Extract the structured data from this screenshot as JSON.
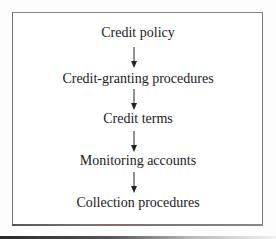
{
  "diagram": {
    "type": "flowchart",
    "direction": "top-to-bottom",
    "steps": [
      {
        "label": "Credit policy"
      },
      {
        "label": "Credit-granting procedures"
      },
      {
        "label": "Credit terms"
      },
      {
        "label": "Monitoring accounts"
      },
      {
        "label": "Collection procedures"
      }
    ],
    "edges": [
      {
        "from": 0,
        "to": 1,
        "icon": "arrow-down-icon"
      },
      {
        "from": 1,
        "to": 2,
        "icon": "arrow-down-icon"
      },
      {
        "from": 2,
        "to": 3,
        "icon": "arrow-down-icon"
      },
      {
        "from": 3,
        "to": 4,
        "icon": "arrow-down-icon"
      }
    ],
    "colors": {
      "text": "#1a1a1a",
      "border": "#6e6e6e",
      "arrow": "#222222",
      "background": "#ffffff"
    }
  }
}
